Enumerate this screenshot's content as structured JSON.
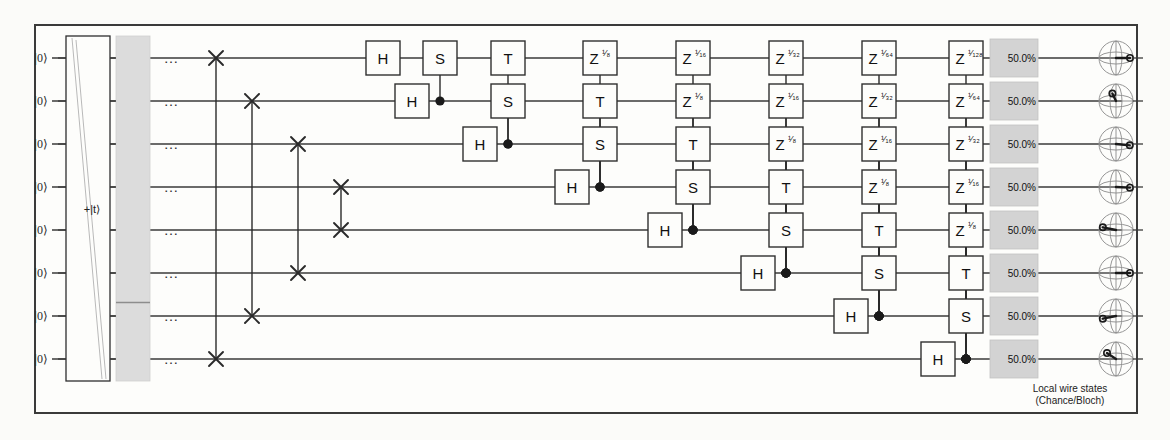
{
  "figure": {
    "background": "#fbfbf9",
    "border_color": "#3a3a3a"
  },
  "legend": {
    "line1": "Local wire states",
    "line2": "(Chance/Bloch)"
  },
  "wires": {
    "count": 8,
    "input_label": "|0⟩",
    "continuation": "…",
    "y": [
      58,
      101,
      144,
      187,
      230,
      273,
      316,
      359
    ]
  },
  "init_stage": {
    "label": "+|t⟩",
    "x": 66,
    "width": 44,
    "grey_column_x": 116,
    "grey_column_width": 34,
    "grey_divider_row": 6
  },
  "swap_network": {
    "x": [
      216,
      252,
      298,
      341
    ],
    "pairs": [
      [
        0,
        7
      ],
      [
        1,
        6
      ],
      [
        2,
        5
      ],
      [
        3,
        4
      ]
    ],
    "glyph": "✕"
  },
  "columns": {
    "x": [
      383,
      440,
      508,
      600,
      693,
      786,
      879,
      966
    ]
  },
  "gates": [
    {
      "col": 0,
      "row": 0,
      "label": "H",
      "type": "single"
    },
    {
      "col": 1,
      "row": 0,
      "label": "S",
      "type": "controlled",
      "control_row": 1
    },
    {
      "col": 1,
      "row": 1,
      "label": "H",
      "type": "single",
      "offset": -28
    },
    {
      "col": 2,
      "row": 0,
      "label": "T",
      "type": "controlled",
      "control_row": 2
    },
    {
      "col": 2,
      "row": 1,
      "label": "S",
      "type": "controlled",
      "control_row": 2
    },
    {
      "col": 2,
      "row": 2,
      "label": "H",
      "type": "single",
      "offset": -28
    },
    {
      "col": 3,
      "row": 0,
      "label": "Z",
      "exp": "¹⁄₈",
      "type": "controlled",
      "control_row": 3
    },
    {
      "col": 3,
      "row": 1,
      "label": "T",
      "type": "controlled",
      "control_row": 3
    },
    {
      "col": 3,
      "row": 2,
      "label": "S",
      "type": "controlled",
      "control_row": 3
    },
    {
      "col": 3,
      "row": 3,
      "label": "H",
      "type": "single",
      "offset": -28
    },
    {
      "col": 4,
      "row": 0,
      "label": "Z",
      "exp": "¹⁄₁₆",
      "type": "controlled",
      "control_row": 4
    },
    {
      "col": 4,
      "row": 1,
      "label": "Z",
      "exp": "¹⁄₈",
      "type": "controlled",
      "control_row": 4
    },
    {
      "col": 4,
      "row": 2,
      "label": "T",
      "type": "controlled",
      "control_row": 4
    },
    {
      "col": 4,
      "row": 3,
      "label": "S",
      "type": "controlled",
      "control_row": 4
    },
    {
      "col": 4,
      "row": 4,
      "label": "H",
      "type": "single",
      "offset": -28
    },
    {
      "col": 5,
      "row": 0,
      "label": "Z",
      "exp": "¹⁄₃₂",
      "type": "controlled",
      "control_row": 5
    },
    {
      "col": 5,
      "row": 1,
      "label": "Z",
      "exp": "¹⁄₁₆",
      "type": "controlled",
      "control_row": 5
    },
    {
      "col": 5,
      "row": 2,
      "label": "Z",
      "exp": "¹⁄₈",
      "type": "controlled",
      "control_row": 5
    },
    {
      "col": 5,
      "row": 3,
      "label": "T",
      "type": "controlled",
      "control_row": 5
    },
    {
      "col": 5,
      "row": 4,
      "label": "S",
      "type": "controlled",
      "control_row": 5
    },
    {
      "col": 5,
      "row": 5,
      "label": "H",
      "type": "single",
      "offset": -28
    },
    {
      "col": 6,
      "row": 0,
      "label": "Z",
      "exp": "¹⁄₆₄",
      "type": "controlled",
      "control_row": 6
    },
    {
      "col": 6,
      "row": 1,
      "label": "Z",
      "exp": "¹⁄₃₂",
      "type": "controlled",
      "control_row": 6
    },
    {
      "col": 6,
      "row": 2,
      "label": "Z",
      "exp": "¹⁄₁₆",
      "type": "controlled",
      "control_row": 6
    },
    {
      "col": 6,
      "row": 3,
      "label": "Z",
      "exp": "¹⁄₈",
      "type": "controlled",
      "control_row": 6
    },
    {
      "col": 6,
      "row": 4,
      "label": "T",
      "type": "controlled",
      "control_row": 6
    },
    {
      "col": 6,
      "row": 5,
      "label": "S",
      "type": "controlled",
      "control_row": 6
    },
    {
      "col": 6,
      "row": 6,
      "label": "H",
      "type": "single",
      "offset": -28
    },
    {
      "col": 7,
      "row": 0,
      "label": "Z",
      "exp": "¹⁄₁₂₈",
      "type": "controlled",
      "control_row": 7
    },
    {
      "col": 7,
      "row": 1,
      "label": "Z",
      "exp": "¹⁄₆₄",
      "type": "controlled",
      "control_row": 7
    },
    {
      "col": 7,
      "row": 2,
      "label": "Z",
      "exp": "¹⁄₃₂",
      "type": "controlled",
      "control_row": 7
    },
    {
      "col": 7,
      "row": 3,
      "label": "Z",
      "exp": "¹⁄₁₆",
      "type": "controlled",
      "control_row": 7
    },
    {
      "col": 7,
      "row": 4,
      "label": "Z",
      "exp": "¹⁄₈",
      "type": "controlled",
      "control_row": 7
    },
    {
      "col": 7,
      "row": 5,
      "label": "T",
      "type": "controlled",
      "control_row": 7
    },
    {
      "col": 7,
      "row": 6,
      "label": "S",
      "type": "controlled",
      "control_row": 7
    },
    {
      "col": 7,
      "row": 7,
      "label": "H",
      "type": "single",
      "offset": -28
    }
  ],
  "readouts": {
    "chance_x": 1024,
    "bloch_x": 1098,
    "values": [
      "50.0%",
      "50.0%",
      "50.0%",
      "50.0%",
      "50.0%",
      "50.0%",
      "50.0%",
      "50.0%"
    ],
    "bloch_angles_deg": [
      0,
      255,
      10,
      5,
      200,
      0,
      160,
      230
    ]
  }
}
